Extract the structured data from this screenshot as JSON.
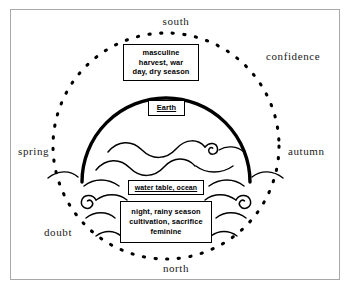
{
  "diagram": {
    "title_alt": "Cosmological diagram of directions, seasons and dualities",
    "colors": {
      "frame": "#a8a8a8",
      "ink": "#000000",
      "background": "#ffffff"
    },
    "compass": {
      "south": "south",
      "north": "north",
      "spring": "spring",
      "autumn": "autumn",
      "confidence": "confidence",
      "doubt": "doubt"
    },
    "boxes": {
      "upper": {
        "name": "masculine-box",
        "lines": [
          "masculine",
          "harvest, war",
          "day, dry season"
        ]
      },
      "earth": {
        "name": "earth-box",
        "lines": [
          "Earth"
        ]
      },
      "watertable": {
        "name": "water-table-box",
        "lines": [
          "water table, ocean"
        ]
      },
      "lower": {
        "name": "night-box",
        "lines": [
          "night, rainy season",
          "cultivation, sacrifice",
          "feminine"
        ]
      }
    },
    "shapes": {
      "outer_circle": "dotted-circle",
      "dome": "thick-semicircle-arc",
      "waves": "wavy-water-lines",
      "spirals": "wave-curl-spirals"
    }
  }
}
